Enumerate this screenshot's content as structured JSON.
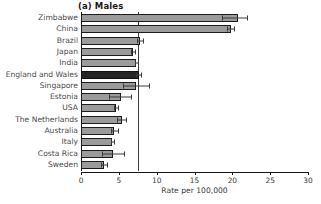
{
  "chart_data": {
    "type": "bar",
    "orientation": "horizontal",
    "title": "(a) Males",
    "xlabel": "Rate per 100,000",
    "ylabel": "",
    "xlim": [
      0,
      30
    ],
    "xticks": [
      0,
      5,
      10,
      15,
      20,
      25,
      30
    ],
    "xtick_labels": [
      "0",
      "5",
      "10",
      "15",
      "20",
      "25",
      "30"
    ],
    "grid": false,
    "legend": null,
    "reference_line": {
      "value": 7.5,
      "orientation": "vertical"
    },
    "categories": [
      "Zimbabwe",
      "China",
      "Brazil",
      "Japan",
      "India",
      "England and Wales",
      "Singapore",
      "Estonia",
      "USA",
      "The Netherlands",
      "Australia",
      "Italy",
      "Costa Rica",
      "Sweden"
    ],
    "values": [
      20.7,
      19.8,
      7.8,
      6.9,
      7.3,
      7.6,
      7.3,
      5.3,
      4.6,
      5.4,
      4.4,
      4.1,
      4.2,
      3.1
    ],
    "error_low": [
      18.6,
      19.3,
      7.4,
      6.6,
      7.1,
      7.3,
      5.6,
      3.7,
      4.4,
      4.7,
      4.0,
      3.9,
      2.8,
      2.7
    ],
    "error_high": [
      21.9,
      20.2,
      8.2,
      7.2,
      7.5,
      7.9,
      9.0,
      6.6,
      4.9,
      6.0,
      4.9,
      4.3,
      5.7,
      3.5
    ],
    "highlight_category": "England and Wales",
    "colors": {
      "bar": "#9b9b9b",
      "bar_highlight": "#262626",
      "bar_edge": "#1c1c1c",
      "axis": "#161616",
      "error_bar": "#3a3a3a",
      "reference_line": "#3d3d3d",
      "label_text": "#4a4a4a",
      "background": "#ffffff"
    }
  }
}
